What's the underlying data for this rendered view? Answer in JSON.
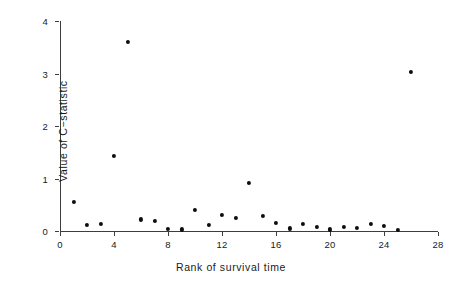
{
  "chart_data": {
    "type": "scatter",
    "title": "",
    "xlabel": "Rank of survival time",
    "ylabel": "Value of C−statistic",
    "xlim": [
      0,
      28
    ],
    "ylim": [
      0,
      4
    ],
    "grid": false,
    "legend": null,
    "x_ticks": [
      0,
      4,
      8,
      12,
      16,
      20,
      24,
      28
    ],
    "x_tick_labels": [
      "0",
      "4",
      "8",
      "12",
      "16",
      "20",
      "24",
      "28"
    ],
    "y_ticks": [
      0,
      1,
      2,
      3,
      4
    ],
    "y_tick_labels": [
      "0",
      "1",
      "2",
      "3",
      "4"
    ],
    "marker": "filled-circle",
    "marker_color": "#0d0d0d",
    "x": [
      1,
      2,
      3,
      4,
      5,
      6,
      7,
      8,
      9,
      10,
      11,
      12,
      13,
      14,
      15,
      16,
      17,
      18,
      19,
      20,
      21,
      22,
      23,
      24,
      25,
      26
    ],
    "y": [
      0.55,
      0.12,
      0.13,
      1.43,
      3.6,
      0.22,
      0.2,
      0.04,
      0.03,
      0.4,
      0.12,
      0.3,
      0.25,
      0.92,
      0.28,
      0.15,
      0.05,
      0.13,
      0.08,
      0.03,
      0.08,
      0.06,
      0.13,
      0.1,
      0.02,
      3.03
    ],
    "points": [
      {
        "rank": 1,
        "value": 0.55
      },
      {
        "rank": 2,
        "value": 0.12
      },
      {
        "rank": 3,
        "value": 0.13
      },
      {
        "rank": 4,
        "value": 1.43
      },
      {
        "rank": 5,
        "value": 3.6
      },
      {
        "rank": 6,
        "value": 0.22
      },
      {
        "rank": 7,
        "value": 0.2
      },
      {
        "rank": 8,
        "value": 0.04
      },
      {
        "rank": 9,
        "value": 0.03
      },
      {
        "rank": 10,
        "value": 0.4
      },
      {
        "rank": 11,
        "value": 0.12
      },
      {
        "rank": 12,
        "value": 0.3
      },
      {
        "rank": 13,
        "value": 0.25
      },
      {
        "rank": 14,
        "value": 0.92
      },
      {
        "rank": 15,
        "value": 0.28
      },
      {
        "rank": 16,
        "value": 0.15
      },
      {
        "rank": 17,
        "value": 0.05
      },
      {
        "rank": 18,
        "value": 0.13
      },
      {
        "rank": 19,
        "value": 0.08
      },
      {
        "rank": 20,
        "value": 0.03
      },
      {
        "rank": 21,
        "value": 0.08
      },
      {
        "rank": 22,
        "value": 0.06
      },
      {
        "rank": 23,
        "value": 0.13
      },
      {
        "rank": 24,
        "value": 0.1
      },
      {
        "rank": 25,
        "value": 0.02
      },
      {
        "rank": 26,
        "value": 3.03
      }
    ]
  }
}
